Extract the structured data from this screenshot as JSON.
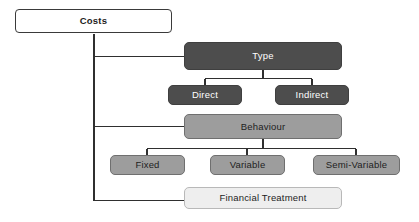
{
  "diagram": {
    "palette": {
      "background": "#ffffff",
      "line": "#2f2f2f",
      "root_fill": "#ffffff",
      "root_border": "#3a3a3a",
      "dark_fill": "#4d4d4d",
      "dark_text": "#ffffff",
      "mid_fill": "#9d9d9d",
      "mid_text": "#1d1d1d",
      "light_fill": "#eeeeee",
      "light_text": "#1d1d1d"
    },
    "nodes": {
      "root": {
        "label": "Costs"
      },
      "type": {
        "label": "Type"
      },
      "direct": {
        "label": "Direct"
      },
      "indirect": {
        "label": "Indirect"
      },
      "behaviour": {
        "label": "Behaviour"
      },
      "fixed": {
        "label": "Fixed"
      },
      "variable": {
        "label": "Variable"
      },
      "semi_variable": {
        "label": "Semi-Variable"
      },
      "financial_treatment": {
        "label": "Financial  Treatment"
      }
    }
  }
}
